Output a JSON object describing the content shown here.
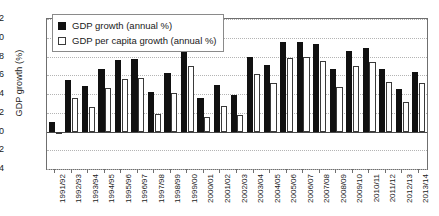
{
  "chart_data": {
    "type": "bar",
    "title": "",
    "xlabel": "",
    "ylabel": "GDP growth (%)",
    "ylim": [
      -4,
      12
    ],
    "yticks": [
      12,
      10,
      8,
      6,
      4,
      2,
      0,
      -2,
      -4
    ],
    "grid": true,
    "legend_position": "upper-left",
    "categories": [
      "1991/92",
      "1992/93",
      "1993/94",
      "1994/95",
      "1995/96",
      "1996/97",
      "1997/98",
      "1998/99",
      "1999/00",
      "2000/01",
      "2001/02",
      "2002/03",
      "2003/04",
      "2004/05",
      "2005/06",
      "2006/07",
      "2007/08",
      "2008/09",
      "2009/10",
      "2010/11",
      "2011/12",
      "2012/13",
      "2013/14"
    ],
    "series": [
      {
        "name": "GDP growth (annual %)",
        "color": "#111111",
        "values": [
          1.0,
          5.5,
          4.9,
          6.7,
          7.6,
          7.7,
          4.2,
          6.2,
          8.8,
          3.6,
          5.0,
          3.9,
          8.0,
          7.1,
          9.5,
          9.6,
          9.3,
          6.7,
          8.6,
          8.9,
          6.7,
          4.5,
          6.4
        ]
      },
      {
        "name": "GDP per capita growth (annual %)",
        "color": "#ffffff",
        "values": [
          0.0,
          3.6,
          2.6,
          4.6,
          5.6,
          5.7,
          1.9,
          4.1,
          7.0,
          1.5,
          2.7,
          1.8,
          6.1,
          5.2,
          7.8,
          7.9,
          7.5,
          4.8,
          7.0,
          7.4,
          5.3,
          3.2,
          5.2
        ]
      }
    ]
  },
  "legend": {
    "items": [
      {
        "label": "GDP growth (annual %)"
      },
      {
        "label": "GDP per capita growth (annual %)"
      }
    ]
  }
}
